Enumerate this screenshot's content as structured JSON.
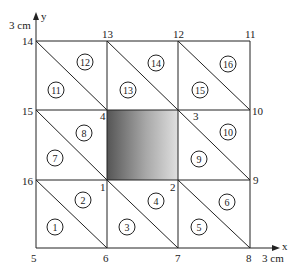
{
  "figure": {
    "type": "finite-element-mesh",
    "axis_x_label": "x",
    "axis_y_label": "y",
    "x_extent_label": "3 cm",
    "y_extent_label": "3 cm",
    "grid_x": [
      36,
      107,
      178,
      250
    ],
    "grid_y": [
      41,
      110,
      180,
      248
    ],
    "shaded_region": {
      "corners": [
        "1",
        "2",
        "3",
        "4"
      ],
      "gradient_from": "#5a5a5a",
      "gradient_to": "#dcdcdc"
    },
    "nodes": [
      {
        "id": "1",
        "label": "1"
      },
      {
        "id": "2",
        "label": "2"
      },
      {
        "id": "3",
        "label": "3"
      },
      {
        "id": "4",
        "label": "4"
      },
      {
        "id": "5",
        "label": "5"
      },
      {
        "id": "6",
        "label": "6"
      },
      {
        "id": "7",
        "label": "7"
      },
      {
        "id": "8",
        "label": "8"
      },
      {
        "id": "9",
        "label": "9"
      },
      {
        "id": "10",
        "label": "10"
      },
      {
        "id": "11",
        "label": "11"
      },
      {
        "id": "12",
        "label": "12"
      },
      {
        "id": "13",
        "label": "13"
      },
      {
        "id": "14",
        "label": "14"
      },
      {
        "id": "15",
        "label": "15"
      },
      {
        "id": "16",
        "label": "16"
      }
    ],
    "elements": [
      {
        "label": "1"
      },
      {
        "label": "2"
      },
      {
        "label": "3"
      },
      {
        "label": "4"
      },
      {
        "label": "5"
      },
      {
        "label": "6"
      },
      {
        "label": "7"
      },
      {
        "label": "8"
      },
      {
        "label": "9"
      },
      {
        "label": "10"
      },
      {
        "label": "11"
      },
      {
        "label": "12"
      },
      {
        "label": "13"
      },
      {
        "label": "14"
      },
      {
        "label": "15"
      },
      {
        "label": "16"
      }
    ]
  }
}
